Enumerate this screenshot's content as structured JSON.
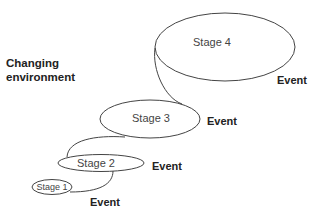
{
  "diagram": {
    "side_label": {
      "line1": "Changing",
      "line2": "environment"
    },
    "stages": [
      {
        "label": "Stage 1"
      },
      {
        "label": "Stage 2"
      },
      {
        "label": "Stage 3"
      },
      {
        "label": "Stage 4"
      }
    ],
    "events": [
      {
        "label": "Event"
      },
      {
        "label": "Event"
      },
      {
        "label": "Event"
      },
      {
        "label": "Event"
      }
    ],
    "colors": {
      "stroke": "#444444",
      "text": "#222222",
      "background": "#ffffff"
    }
  }
}
